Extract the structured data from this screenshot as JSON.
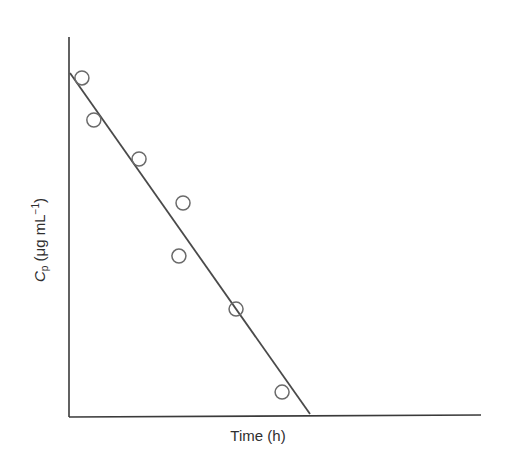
{
  "chart_data": {
    "type": "scatter",
    "title": "",
    "xlabel": "Time (h)",
    "ylabel": "Cp (μg mL−1)",
    "ylabel_parts": {
      "symbol": "C",
      "subscript": "p",
      "unit_open": " (μg mL",
      "superscript": "−1",
      "unit_close": ")"
    },
    "xlim": [
      0,
      100
    ],
    "ylim": [
      0,
      100
    ],
    "grid": false,
    "legend": null,
    "tick_labels": "none (axes unlabeled, arbitrary units)",
    "series": [
      {
        "name": "observed",
        "marker": "open-circle",
        "points": [
          {
            "x": 2.9,
            "y": 89.2
          },
          {
            "x": 5.8,
            "y": 78.1
          },
          {
            "x": 16.8,
            "y": 67.8
          },
          {
            "x": 27.5,
            "y": 56.2
          },
          {
            "x": 26.5,
            "y": 42.2
          },
          {
            "x": 40.4,
            "y": 28.2
          },
          {
            "x": 51.6,
            "y": 6.3
          }
        ]
      },
      {
        "name": "linear fit",
        "marker": "line",
        "points": [
          {
            "x": 0,
            "y": 90.5
          },
          {
            "x": 58.4,
            "y": 0.5
          }
        ]
      }
    ]
  },
  "colors": {
    "axis": "#3a3a3a",
    "line": "#4a4a4a",
    "marker": "#6a6a6a"
  }
}
